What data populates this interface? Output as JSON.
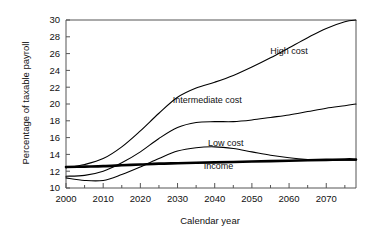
{
  "chart_data": {
    "type": "line",
    "title": "",
    "xlabel": "Calendar year",
    "ylabel": "Percentage of taxable payroll",
    "xlim": [
      2000,
      2078
    ],
    "ylim": [
      10,
      30
    ],
    "grid": false,
    "legend_position": "inline-annotations",
    "xticks": [
      2000,
      2010,
      2020,
      2030,
      2040,
      2050,
      2060,
      2070
    ],
    "xtick_labels": [
      "2000",
      "2010",
      "2020",
      "2030",
      "2040",
      "2050",
      "2060",
      "2070"
    ],
    "xminor_step": 5,
    "yticks": [
      10,
      12,
      14,
      16,
      18,
      20,
      22,
      24,
      26,
      28,
      30
    ],
    "ytick_labels": [
      "10",
      "12",
      "14",
      "16",
      "18",
      "20",
      "22",
      "24",
      "26",
      "28",
      "30"
    ],
    "x": [
      2000,
      2005,
      2010,
      2015,
      2020,
      2025,
      2030,
      2035,
      2040,
      2045,
      2050,
      2055,
      2060,
      2065,
      2070,
      2075,
      2078
    ],
    "series": [
      {
        "name": "High cost",
        "label": "High cost",
        "style": "thin",
        "values": [
          12.4,
          12.8,
          13.5,
          14.9,
          16.8,
          18.9,
          20.8,
          21.9,
          22.6,
          23.4,
          24.4,
          25.5,
          26.7,
          27.9,
          29.0,
          29.8,
          30.0
        ]
      },
      {
        "name": "Intermediate cost",
        "label": "Intermediate cost",
        "style": "thin",
        "values": [
          11.4,
          11.5,
          12.0,
          13.0,
          14.3,
          15.9,
          17.2,
          17.8,
          17.9,
          17.9,
          18.1,
          18.4,
          18.7,
          19.1,
          19.5,
          19.8,
          20.0
        ]
      },
      {
        "name": "Low cost",
        "label": "Low cost",
        "style": "thin",
        "values": [
          11.2,
          10.9,
          10.9,
          11.6,
          12.5,
          13.5,
          14.4,
          14.8,
          14.9,
          14.7,
          14.3,
          13.9,
          13.6,
          13.4,
          13.3,
          13.3,
          13.3
        ]
      },
      {
        "name": "Income",
        "label": "Income",
        "style": "thick",
        "values": [
          12.5,
          12.55,
          12.6,
          12.7,
          12.8,
          12.9,
          12.95,
          13.0,
          13.05,
          13.1,
          13.15,
          13.2,
          13.25,
          13.3,
          13.35,
          13.4,
          13.4
        ]
      }
    ],
    "annotations": [
      {
        "text": "High cost",
        "x": 2060,
        "y": 26.0
      },
      {
        "text": "Intermediate cost",
        "x": 2038,
        "y": 20.1
      },
      {
        "text": "Low cost",
        "x": 2043,
        "y": 15.0
      },
      {
        "text": "Income",
        "x": 2041,
        "y": 12.3
      }
    ]
  }
}
